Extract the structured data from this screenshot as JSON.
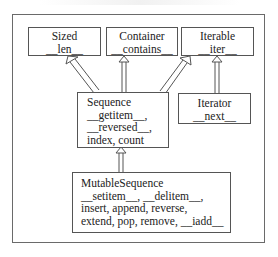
{
  "diagram": {
    "type": "class-hierarchy",
    "boxes": {
      "sized": {
        "name": "Sized",
        "methods": "__len__"
      },
      "container": {
        "name": "Container",
        "methods": "__contains__"
      },
      "iterable": {
        "name": "Iterable",
        "methods": "__iter__"
      },
      "sequence": {
        "name": "Sequence",
        "line1": "__getitem__,",
        "line2": "__reversed__,",
        "line3": "index, count"
      },
      "iterator": {
        "name": "Iterator",
        "methods": "__next__"
      },
      "mutable_sequence": {
        "name": "MutableSequence",
        "line1": "__setitem__, __delitem__,",
        "line2": "insert, append, reverse,",
        "line3": "extend, pop, remove, __iadd__"
      }
    },
    "edges": [
      {
        "from": "Sequence",
        "to": "Sized"
      },
      {
        "from": "Sequence",
        "to": "Container"
      },
      {
        "from": "Sequence",
        "to": "Iterable"
      },
      {
        "from": "Iterator",
        "to": "Iterable"
      },
      {
        "from": "MutableSequence",
        "to": "Sequence"
      }
    ],
    "colors": {
      "line": "#555555",
      "frame": "#6a6a6a",
      "background": "#ffffff"
    }
  }
}
